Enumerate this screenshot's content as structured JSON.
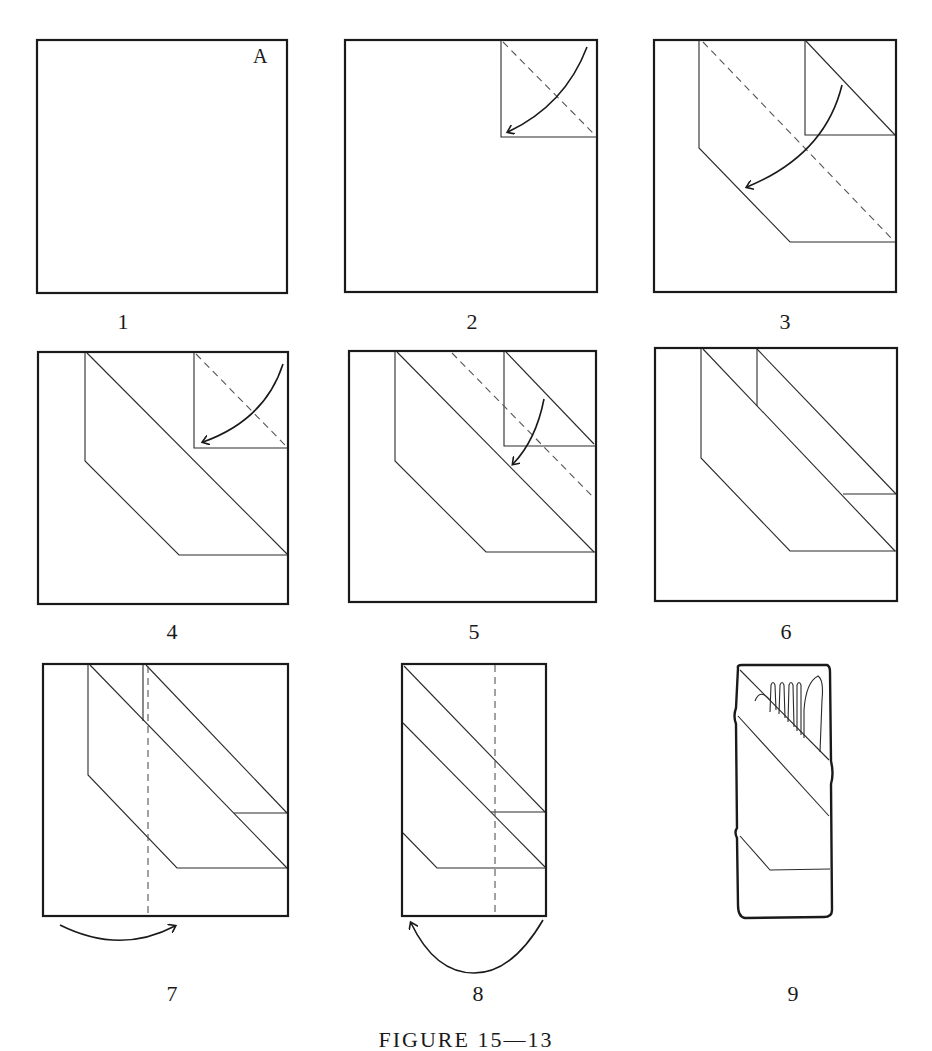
{
  "figure": {
    "caption": "FIGURE 15—13",
    "corner_label": "A",
    "steps": [
      {
        "number": "1",
        "description": "Flat square napkin, corner A at upper right"
      },
      {
        "number": "2",
        "description": "Fold corner A down to center along dashed line"
      },
      {
        "number": "3",
        "description": "Fold along diagonal dashed line"
      },
      {
        "number": "4",
        "description": "Fold top-right corner down along dashed line"
      },
      {
        "number": "5",
        "description": "Fold down along dashed diagonal"
      },
      {
        "number": "6",
        "description": "Resulting stepped diagonal bands"
      },
      {
        "number": "7",
        "description": "Fold left side under along vertical dashed line"
      },
      {
        "number": "8",
        "description": "Fold right side under along vertical dashed line"
      },
      {
        "number": "9",
        "description": "Finished pouch holding knife and fork"
      }
    ]
  },
  "colors": {
    "ink": "#1a1a1a",
    "paper": "#ffffff",
    "dash": "#555555"
  }
}
